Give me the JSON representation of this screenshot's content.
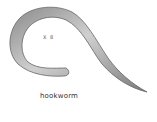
{
  "figure": {
    "magnification": "X 8",
    "caption": "hookworm",
    "colors": {
      "worm_dark": "#6e6e6e",
      "worm_light": "#d4d4d4",
      "text": "#333333",
      "background": "#ffffff"
    }
  }
}
